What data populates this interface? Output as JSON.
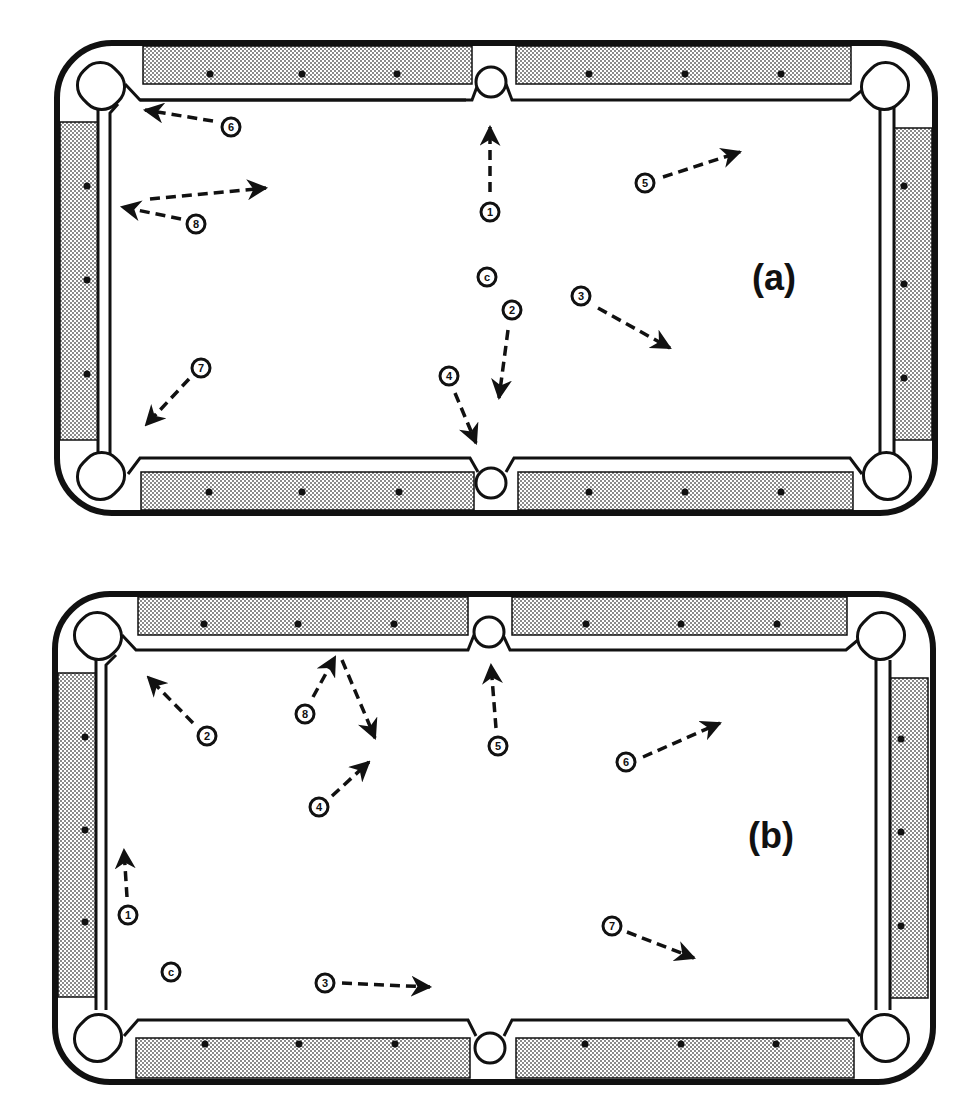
{
  "figure": {
    "colors": {
      "ink": "#111111",
      "felt": "#ffffff",
      "rail_pattern": "#9a9a9a",
      "background": "#ffffff"
    }
  },
  "panels": [
    {
      "id": "a",
      "label": "(a)",
      "cue_ball": {
        "label": "c",
        "x": 487,
        "y": 277
      },
      "balls": [
        {
          "label": "1",
          "x": 490,
          "y": 212,
          "arrow": {
            "from": [
              490,
              192
            ],
            "to": [
              490,
              127
            ]
          }
        },
        {
          "label": "2",
          "x": 512,
          "y": 310,
          "arrow": {
            "from": [
              508,
              330
            ],
            "to": [
              499,
              398
            ]
          }
        },
        {
          "label": "3",
          "x": 581,
          "y": 296,
          "arrow": {
            "from": [
              598,
              308
            ],
            "to": [
              670,
              348
            ]
          }
        },
        {
          "label": "4",
          "x": 449,
          "y": 376,
          "arrow": {
            "from": [
              455,
              393
            ],
            "to": [
              476,
              443
            ]
          }
        },
        {
          "label": "5",
          "x": 645,
          "y": 183,
          "arrow": {
            "from": [
              663,
              177
            ],
            "to": [
              740,
              152
            ]
          }
        },
        {
          "label": "6",
          "x": 231,
          "y": 127,
          "arrow": {
            "from": [
              213,
              121
            ],
            "to": [
              145,
              110
            ]
          }
        },
        {
          "label": "7",
          "x": 201,
          "y": 368,
          "arrow": {
            "from": [
              189,
              379
            ],
            "to": [
              146,
              425
            ]
          }
        },
        {
          "label": "8",
          "x": 196,
          "y": 224,
          "arrow": {
            "from": [
              181,
              219
            ],
            "to": [
              122,
              207
            ]
          }
        },
        {
          "label": "",
          "x": null,
          "y": null,
          "arrow": {
            "from": [
              150,
              199
            ],
            "to": [
              266,
              188
            ]
          }
        }
      ]
    },
    {
      "id": "b",
      "label": "(b)",
      "cue_ball": {
        "label": "c",
        "x": 171,
        "y": 972
      },
      "balls": [
        {
          "label": "1",
          "x": 128,
          "y": 915,
          "arrow": {
            "from": [
              127,
              897
            ],
            "to": [
              124,
              850
            ]
          }
        },
        {
          "label": "2",
          "x": 207,
          "y": 736,
          "arrow": {
            "from": [
              193,
              723
            ],
            "to": [
              148,
              677
            ]
          }
        },
        {
          "label": "3",
          "x": 325,
          "y": 983,
          "arrow": {
            "from": [
              342,
              983
            ],
            "to": [
              430,
              987
            ]
          }
        },
        {
          "label": "4",
          "x": 319,
          "y": 807,
          "arrow": {
            "from": [
              332,
              796
            ],
            "to": [
              369,
              762
            ]
          }
        },
        {
          "label": "5",
          "x": 498,
          "y": 746,
          "arrow": {
            "from": [
              496,
              728
            ],
            "to": [
              491,
              665
            ]
          }
        },
        {
          "label": "6",
          "x": 626,
          "y": 762,
          "arrow": {
            "from": [
              643,
              757
            ],
            "to": [
              720,
              723
            ]
          }
        },
        {
          "label": "7",
          "x": 612,
          "y": 926,
          "arrow": {
            "from": [
              627,
              932
            ],
            "to": [
              694,
              958
            ]
          }
        },
        {
          "label": "8",
          "x": 305,
          "y": 714,
          "arrow": {
            "from": [
              313,
              697
            ],
            "to": [
              335,
              657
            ]
          }
        },
        {
          "label": "",
          "x": null,
          "y": null,
          "arrow": {
            "from": [
              342,
              660
            ],
            "to": [
              375,
              738
            ]
          }
        }
      ]
    }
  ]
}
